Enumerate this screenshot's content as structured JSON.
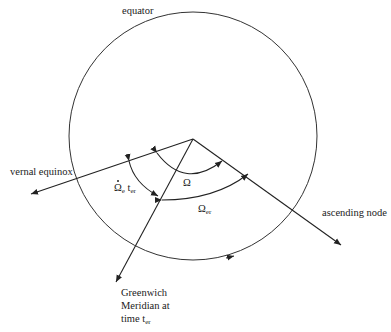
{
  "diagram": {
    "type": "orbital-geometry",
    "labels": {
      "equator": "equator",
      "vernal_equinox": "vernal equinox",
      "ascending_node": "ascending node",
      "greenwich_line1": "Greenwich",
      "greenwich_line2": "Meridian at",
      "greenwich_line3_prefix": "time t",
      "greenwich_line3_sub": "er"
    },
    "angles": {
      "omega": {
        "symbol": "Ω"
      },
      "omega_er": {
        "symbol": "Ω",
        "sub": "er"
      },
      "earth_rotation": {
        "symbol": "Ω",
        "sub": "e",
        "time": "t",
        "time_sub": "er",
        "dotted": true
      }
    },
    "geometry": {
      "circle": {
        "cx": 193,
        "cy": 136,
        "r": 124
      },
      "center": {
        "x": 193,
        "y": 139
      },
      "rays": {
        "vernal_equinox": {
          "x2": 30,
          "y2": 194
        },
        "ascending_node": {
          "x2": 341,
          "y2": 245
        },
        "greenwich": {
          "x2": 116,
          "y2": 282
        }
      }
    },
    "colors": {
      "stroke": "#222222",
      "background": "#ffffff"
    }
  }
}
